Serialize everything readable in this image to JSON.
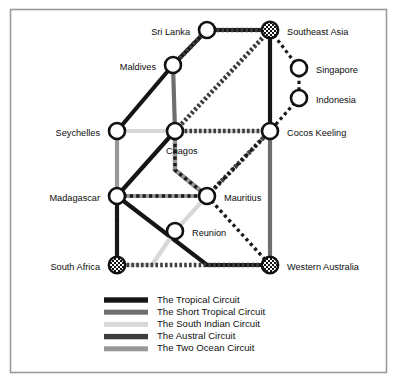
{
  "figure": {
    "type": "network-route-diagram",
    "frame_color": "#9a9a9a",
    "background": "#ffffff"
  },
  "palette": {
    "tropical": "#151515",
    "short_tropical": "#6e6e6e",
    "south_indian": "#d8d8d8",
    "austral": "#3d3d3d",
    "two_ocean": "#989898",
    "node_stroke": "#111111",
    "node_fill": "#ffffff",
    "checker_dark": "#141414",
    "checker_light": "#ffffff"
  },
  "nodes": [
    {
      "id": "sri_lanka",
      "label": "Sri Lanka",
      "x": 207,
      "y": 30,
      "style": "open",
      "label_x": 190,
      "label_y": 33,
      "anchor": "end"
    },
    {
      "id": "southeast_asia",
      "label": "Southeast Asia",
      "x": 270,
      "y": 30,
      "style": "checkered",
      "label_x": 287,
      "label_y": 33,
      "anchor": "start"
    },
    {
      "id": "maldives",
      "label": "Maldives",
      "x": 173,
      "y": 65,
      "style": "open",
      "label_x": 156,
      "label_y": 68,
      "anchor": "end"
    },
    {
      "id": "singapore",
      "label": "Singapore",
      "x": 299,
      "y": 68,
      "style": "open",
      "label_x": 316,
      "label_y": 71,
      "anchor": "start"
    },
    {
      "id": "indonesia",
      "label": "Indonesia",
      "x": 299,
      "y": 98,
      "style": "open",
      "label_x": 316,
      "label_y": 101,
      "anchor": "start"
    },
    {
      "id": "seychelles",
      "label": "Seychelles",
      "x": 117,
      "y": 131,
      "style": "open",
      "label_x": 100,
      "label_y": 134,
      "anchor": "end"
    },
    {
      "id": "chagos",
      "label": "Chagos",
      "x": 175,
      "y": 131,
      "style": "open",
      "label_x": 166,
      "label_y": 152,
      "anchor": "start"
    },
    {
      "id": "cocos_keeling",
      "label": "Cocos Keeling",
      "x": 270,
      "y": 131,
      "style": "open",
      "label_x": 287,
      "label_y": 134,
      "anchor": "start"
    },
    {
      "id": "madagascar",
      "label": "Madagascar",
      "x": 117,
      "y": 196,
      "style": "open",
      "label_x": 100,
      "label_y": 199,
      "anchor": "end"
    },
    {
      "id": "mauritius",
      "label": "Mauritius",
      "x": 207,
      "y": 196,
      "style": "open",
      "label_x": 224,
      "label_y": 199,
      "anchor": "start"
    },
    {
      "id": "reunion",
      "label": "Reunion",
      "x": 175,
      "y": 231,
      "style": "open",
      "label_x": 192,
      "label_y": 234,
      "anchor": "start"
    },
    {
      "id": "south_africa",
      "label": "South Africa",
      "x": 117,
      "y": 265,
      "style": "checkered",
      "label_x": 100,
      "label_y": 268,
      "anchor": "end"
    },
    {
      "id": "western_australia",
      "label": "Western Australia",
      "x": 270,
      "y": 265,
      "style": "checkered",
      "label_x": 287,
      "label_y": 268,
      "anchor": "start"
    }
  ],
  "routes": [
    {
      "id": "tropical",
      "circuit": "The Tropical Circuit",
      "color": "#151515",
      "width": 4.2,
      "dash": "none",
      "path": [
        [
          "maldives"
        ],
        [
          "sri_lanka"
        ],
        [
          "southeast_asia"
        ]
      ]
    },
    {
      "id": "tropical_b",
      "circuit": "The Tropical Circuit",
      "color": "#151515",
      "width": 4.2,
      "dash": "none",
      "path": [
        [
          "seychelles"
        ],
        [
          "maldives"
        ]
      ]
    },
    {
      "id": "tropical_c",
      "circuit": "The Tropical Circuit",
      "color": "#151515",
      "width": 4.2,
      "dash": "none",
      "path": [
        [
          "chagos"
        ],
        [
          "cocos_keeling"
        ]
      ]
    },
    {
      "id": "tropical_d",
      "circuit": "The Tropical Circuit",
      "color": "#151515",
      "width": 4.2,
      "dash": "none",
      "path": [
        [
          "southeast_asia"
        ],
        [
          "cocos_keeling"
        ]
      ]
    },
    {
      "id": "tropical_e",
      "circuit": "The Tropical Circuit",
      "color": "#151515",
      "width": 4.2,
      "dash": "none",
      "path": [
        [
          "chagos"
        ],
        [
          "madagascar"
        ]
      ]
    },
    {
      "id": "tropical_f",
      "circuit": "The Tropical Circuit",
      "color": "#151515",
      "width": 4.2,
      "dash": "none",
      "path": [
        [
          "madagascar"
        ],
        [
          "south_africa"
        ]
      ]
    },
    {
      "id": "tropical_g",
      "circuit": "The Tropical Circuit",
      "color": "#151515",
      "width": 4.2,
      "dash": "none",
      "path": [
        [
          "madagascar"
        ],
        [
          "wa_bend"
        ],
        [
          "western_australia"
        ]
      ]
    },
    {
      "id": "short_tropical_a",
      "circuit": "The Short Tropical Circuit",
      "color": "#6e6e6e",
      "width": 4.2,
      "dash": "none",
      "path": [
        [
          "maldives"
        ],
        [
          "chagos"
        ]
      ]
    },
    {
      "id": "short_tropical_b",
      "circuit": "The Short Tropical Circuit",
      "color": "#6e6e6e",
      "width": 4.2,
      "dash": "none",
      "path": [
        [
          "seychelles"
        ],
        [
          "chagos"
        ]
      ]
    },
    {
      "id": "short_tropical_c",
      "circuit": "The Short Tropical Circuit",
      "color": "#6e6e6e",
      "width": 4.2,
      "dash": "none",
      "path": [
        [
          "chagos"
        ],
        [
          "chagos_bend"
        ],
        [
          "mauritius"
        ]
      ]
    },
    {
      "id": "short_tropical_d",
      "circuit": "The Short Tropical Circuit",
      "color": "#6e6e6e",
      "width": 4.2,
      "dash": "none",
      "path": [
        [
          "madagascar"
        ],
        [
          "mauritius"
        ]
      ]
    },
    {
      "id": "short_tropical_e",
      "circuit": "The Short Tropical Circuit",
      "color": "#6e6e6e",
      "width": 4.2,
      "dash": "none",
      "path": [
        [
          "cocos_keeling"
        ],
        [
          "western_australia"
        ]
      ]
    },
    {
      "id": "south_indian_a",
      "circuit": "The South Indian Circuit",
      "color": "#d8d8d8",
      "width": 4.2,
      "dash": "none",
      "path": [
        [
          "seychelles"
        ],
        [
          "chagos"
        ]
      ]
    },
    {
      "id": "south_indian_b",
      "circuit": "The South Indian Circuit",
      "color": "#d8d8d8",
      "width": 4.2,
      "dash": "none",
      "path": [
        [
          "chagos"
        ],
        [
          "cocos_keeling"
        ]
      ]
    },
    {
      "id": "south_indian_c",
      "circuit": "The South Indian Circuit",
      "color": "#d8d8d8",
      "width": 4.2,
      "dash": "none",
      "path": [
        [
          "mauritius"
        ],
        [
          "reunion"
        ],
        [
          "sa_bend"
        ],
        [
          "south_africa"
        ]
      ]
    },
    {
      "id": "austral_a",
      "circuit": "The Austral Circuit",
      "color": "#3d3d3d",
      "width": 4.6,
      "dash": "hatched",
      "path": [
        [
          "sri_lanka"
        ],
        [
          "southeast_asia"
        ]
      ]
    },
    {
      "id": "austral_b",
      "circuit": "The Austral Circuit",
      "color": "#3d3d3d",
      "width": 4.6,
      "dash": "hatched",
      "path": [
        [
          "maldives"
        ],
        [
          "sri_lanka"
        ]
      ]
    },
    {
      "id": "austral_c",
      "circuit": "The Austral Circuit",
      "color": "#3d3d3d",
      "width": 4.6,
      "dash": "hatched",
      "path": [
        [
          "chagos"
        ],
        [
          "southeast_asia"
        ]
      ]
    },
    {
      "id": "austral_d",
      "circuit": "The Austral Circuit",
      "color": "#3d3d3d",
      "width": 4.6,
      "dash": "hatched",
      "path": [
        [
          "chagos"
        ],
        [
          "cocos_keeling"
        ]
      ]
    },
    {
      "id": "austral_e",
      "circuit": "The Austral Circuit",
      "color": "#3d3d3d",
      "width": 4.6,
      "dash": "hatched",
      "path": [
        [
          "cocos_keeling"
        ],
        [
          "mauritius"
        ]
      ]
    },
    {
      "id": "austral_f",
      "circuit": "The Austral Circuit",
      "color": "#3d3d3d",
      "width": 4.6,
      "dash": "hatched",
      "path": [
        [
          "south_africa"
        ],
        [
          "western_australia"
        ]
      ]
    },
    {
      "id": "two_ocean_a",
      "circuit": "The Two Ocean Circuit",
      "color": "#989898",
      "width": 4.2,
      "dash": "none",
      "path": [
        [
          "seychelles"
        ],
        [
          "madagascar"
        ]
      ]
    },
    {
      "id": "two_ocean_b",
      "circuit": "The Two Ocean Circuit",
      "color": "#989898",
      "width": 4.2,
      "dash": "none",
      "path": [
        [
          "madagascar"
        ],
        [
          "mauritius"
        ]
      ]
    },
    {
      "id": "two_ocean_c",
      "circuit": "The Two Ocean Circuit",
      "color": "#989898",
      "width": 4.2,
      "dash": "none",
      "path": [
        [
          "chagos"
        ],
        [
          "chagos_bend"
        ],
        [
          "mauritius"
        ]
      ]
    },
    {
      "id": "dotted_sea_sing",
      "circuit": "dotted-link",
      "color": "#1a1a1a",
      "width": 3.2,
      "dash": "dotted",
      "path": [
        [
          "southeast_asia"
        ],
        [
          "singapore"
        ]
      ]
    },
    {
      "id": "dotted_sing_indo",
      "circuit": "dotted-link",
      "color": "#1a1a1a",
      "width": 3.2,
      "dash": "dotted",
      "path": [
        [
          "singapore"
        ],
        [
          "indonesia"
        ]
      ]
    },
    {
      "id": "dotted_indo_cocos",
      "circuit": "dotted-link",
      "color": "#1a1a1a",
      "width": 3.2,
      "dash": "dotted",
      "path": [
        [
          "indonesia"
        ],
        [
          "cocos_keeling"
        ]
      ]
    },
    {
      "id": "dotted_chagos_mau",
      "circuit": "dotted-link",
      "color": "#1a1a1a",
      "width": 3.4,
      "dash": "dotted",
      "path": [
        [
          "chagos"
        ],
        [
          "chagos_bend"
        ],
        [
          "mauritius"
        ]
      ]
    },
    {
      "id": "dotted_mad_mau",
      "circuit": "dotted-link",
      "color": "#1a1a1a",
      "width": 3.4,
      "dash": "dotted",
      "path": [
        [
          "madagascar"
        ],
        [
          "mauritius"
        ]
      ]
    },
    {
      "id": "dotted_mad_sa",
      "circuit": "dotted-link",
      "color": "#1a1a1a",
      "width": 3.4,
      "dash": "dotted",
      "path": [
        [
          "madagascar"
        ],
        [
          "south_africa"
        ]
      ]
    },
    {
      "id": "dotted_mau_wa",
      "circuit": "dotted-link",
      "color": "#1a1a1a",
      "width": 3.4,
      "dash": "dotted",
      "path": [
        [
          "mauritius"
        ],
        [
          "western_australia"
        ]
      ]
    },
    {
      "id": "dotted_cocos_mau",
      "circuit": "dotted-link",
      "color": "#1a1a1a",
      "width": 3.4,
      "dash": "dotted",
      "path": [
        [
          "cocos_keeling"
        ],
        [
          "mauritius"
        ]
      ]
    }
  ],
  "legend": {
    "x": 104,
    "y": 300,
    "row_height": 12.2,
    "swatch_width": 44,
    "swatch_height": 5,
    "items": [
      {
        "id": "legend-tropical",
        "label": "The Tropical Circuit",
        "color": "#151515",
        "height": 5.4
      },
      {
        "id": "legend-short-tropical",
        "label": "The Short Tropical Circuit",
        "color": "#6e6e6e",
        "height": 5.0
      },
      {
        "id": "legend-south-indian",
        "label": "The South Indian Circuit",
        "color": "#d8d8d8",
        "height": 5.0
      },
      {
        "id": "legend-austral",
        "label": "The Austral Circuit",
        "color": "#3d3d3d",
        "height": 5.4
      },
      {
        "id": "legend-two-ocean",
        "label": "The Two Ocean Circuit",
        "color": "#989898",
        "height": 5.0
      }
    ]
  }
}
